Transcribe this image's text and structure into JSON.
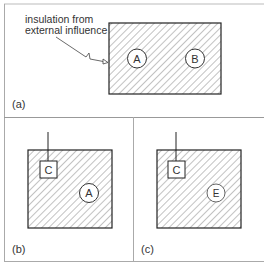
{
  "panels": {
    "a": {
      "label": "(a)",
      "annotation_line1": "insulation from",
      "annotation_line2": "external influence",
      "circles": [
        "A",
        "B"
      ]
    },
    "b": {
      "label": "(b)",
      "box": "C",
      "circle": "A"
    },
    "c": {
      "label": "(c)",
      "box": "C",
      "circle": "E"
    }
  },
  "colors": {
    "line": "#2a2a2a",
    "hatch": "#555555",
    "divider": "#9a9a9a",
    "background": "#ffffff"
  }
}
